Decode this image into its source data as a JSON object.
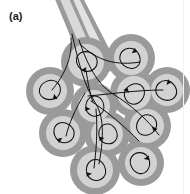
{
  "figure": {
    "panel_label": "(a)",
    "caption_visible": "",
    "background_color": "#ffffff"
  },
  "colors": {
    "cell_outer_membrane": "#9a9a9a",
    "cell_cytoplasm": "#d2d2d2",
    "duct_wall": "#9a9a9a",
    "duct_lumen": "#d9d9d9",
    "duct_lumen_light": "#e4e4e4",
    "nerve_fiber": "#101010",
    "label_text": "#1c1c1c",
    "edge_rule": "#f2f2f2"
  },
  "duct": {
    "name": "excretory-duct",
    "wall_width": 3,
    "has_center_septum": true,
    "outer_path": "M 56 -6 L 78 -6 L 113 64 L 86 78 Z",
    "inner_path": "M 60 -6 L 74 -6 L 107 63 L 90 72 Z",
    "septum_path": "M 67 -6 L 99 68"
  },
  "acinar_cells": [
    {
      "id": 1,
      "name": "acinar-cell-top-left",
      "cx": 86,
      "cy": 62,
      "r_outer": 25,
      "r_inner": 18,
      "arrow_rotation": 200,
      "arrow_scale": 1.0
    },
    {
      "id": 2,
      "name": "acinar-cell-top-right",
      "cx": 131,
      "cy": 58,
      "r_outer": 24,
      "r_inner": 17,
      "arrow_rotation": 35,
      "arrow_scale": 1.0
    },
    {
      "id": 3,
      "name": "acinar-cell-left-upper",
      "cx": 50,
      "cy": 91,
      "r_outer": 24,
      "r_inner": 17,
      "arrow_rotation": 150,
      "arrow_scale": 1.0
    },
    {
      "id": 4,
      "name": "acinar-cell-center-upper",
      "cx": 94,
      "cy": 106,
      "r_outer": 23,
      "r_inner": 16,
      "arrow_rotation": 255,
      "arrow_scale": 0.95
    },
    {
      "id": 5,
      "name": "acinar-cell-middle",
      "cx": 134,
      "cy": 93,
      "r_outer": 24,
      "r_inner": 17,
      "arrow_rotation": 300,
      "arrow_scale": 1.0
    },
    {
      "id": 6,
      "name": "acinar-cell-right-upper",
      "cx": 167,
      "cy": 90,
      "r_outer": 23,
      "r_inner": 16,
      "arrow_rotation": 20,
      "arrow_scale": 1.0
    },
    {
      "id": 7,
      "name": "acinar-cell-left-lower",
      "cx": 63,
      "cy": 133,
      "r_outer": 24,
      "r_inner": 17,
      "arrow_rotation": 215,
      "arrow_scale": 1.0
    },
    {
      "id": 8,
      "name": "acinar-cell-center-lower",
      "cx": 107,
      "cy": 134,
      "r_outer": 23,
      "r_inner": 16,
      "arrow_rotation": 240,
      "arrow_scale": 0.95
    },
    {
      "id": 9,
      "name": "acinar-cell-right-middle",
      "cx": 147,
      "cy": 126,
      "r_outer": 24,
      "r_inner": 17,
      "arrow_rotation": 120,
      "arrow_scale": 1.0
    },
    {
      "id": 10,
      "name": "acinar-cell-bottom-center",
      "cx": 95,
      "cy": 170,
      "r_outer": 25,
      "r_inner": 18,
      "arrow_rotation": 245,
      "arrow_scale": 1.0
    },
    {
      "id": 11,
      "name": "acinar-cell-bottom-right",
      "cx": 141,
      "cy": 163,
      "r_outer": 23,
      "r_inner": 16,
      "arrow_rotation": 60,
      "arrow_scale": 1.0
    }
  ],
  "nerve_fibers": {
    "name": "autonomic-nerve-fibers",
    "stroke_width": 1.0,
    "trunk_paths": [
      "M 72 38 C 78 62 84 86 96 104 C 104 118 104 140 100 162",
      "M 78 42 C 86 66 96 84 112 94 C 130 104 146 118 158 134",
      "M 70 40 C 72 60 62 78 52 90",
      "M 80 44 C 96 60 116 66 140 62",
      "M 88 96 C 112 94 134 90 162 90",
      "M 90 100 C 108 112 122 124 138 140",
      "M 84 92 C 74 108 68 124 66 136",
      "M 96 108 C 98 130 96 152 94 168"
    ]
  },
  "edge_rules": [
    {
      "name": "right-edge-rule",
      "x": 183,
      "y": 0,
      "w": 1,
      "h": 194
    }
  ]
}
